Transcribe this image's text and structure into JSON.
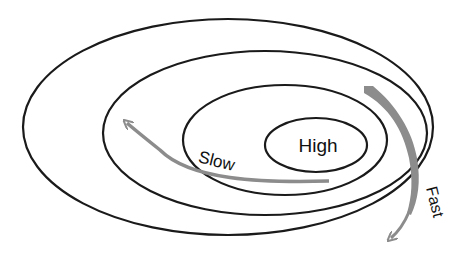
{
  "diagram": {
    "type": "nested-ellipses",
    "labels": {
      "center": "High",
      "slow": "Slow",
      "fast": "Fast"
    },
    "rings": [
      {
        "name": "outer",
        "cx": 228,
        "cy": 127,
        "rx": 205,
        "ry": 108
      },
      {
        "name": "second",
        "cx": 265,
        "cy": 133,
        "rx": 162,
        "ry": 82
      },
      {
        "name": "third",
        "cx": 285,
        "cy": 140,
        "rx": 102,
        "ry": 55
      },
      {
        "name": "inner-high",
        "cx": 316,
        "cy": 145,
        "rx": 51,
        "ry": 27
      }
    ],
    "colors": {
      "ring_stroke": "#1a1a1a",
      "arrow": "#8c8c8c",
      "background": "#ffffff"
    }
  }
}
